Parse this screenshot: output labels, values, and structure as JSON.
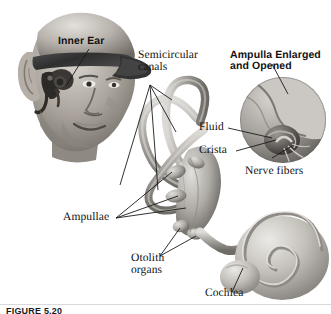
{
  "figure": {
    "title": "Inner Ear",
    "caption": "FIGURE 5.20",
    "background_color": "#ffffff",
    "ink_color": "#111111",
    "art_style": "grayscale airbrush anatomical illustration"
  },
  "labels": {
    "inner_ear": "Inner Ear",
    "semicircular_canals_line1": "Semicircular",
    "semicircular_canals_line2": "canals",
    "ampulla_enlarged_line1": "Ampulla Enlarged",
    "ampulla_enlarged_line2": "and Opened",
    "fluid": "Fluid",
    "crista": "Crista",
    "nerve_fibers": "Nerve fibers",
    "ampullae": "Ampullae",
    "otolith_organs_line1": "Otolith",
    "otolith_organs_line2": "organs",
    "cochlea": "Cochlea"
  },
  "colors": {
    "ink": "#111111",
    "leader_line": "#1b1b1b",
    "head_skin_light": "#d8d4cf",
    "head_skin_mid": "#a9a39c",
    "head_skin_dark": "#6f6a65",
    "cap_dark": "#3a3a3a",
    "labyrinth_light": "#d2d0cd",
    "labyrinth_mid": "#a3a09c",
    "labyrinth_dark": "#6b6864",
    "inset_disc_light": "#cfcdc9",
    "inset_disc_mid": "#9d9a95",
    "inset_disc_dark": "#585450",
    "cochlea_light": "#e0ded9",
    "cochlea_mid": "#b2afa9",
    "cochlea_dark": "#7b7772"
  },
  "parts": [
    {
      "name": "head",
      "description": "Man's head in three-quarter view with cap brim"
    },
    {
      "name": "inner-ear-embedded",
      "description": "Dark inner ear structure shown inside the skull"
    },
    {
      "name": "semicircular-canals",
      "description": "Three looping tubular canals of the vestibular labyrinth"
    },
    {
      "name": "vestibule-ampullae",
      "description": "Bulging ampullae at canal bases"
    },
    {
      "name": "otolith-organs",
      "description": "Utricle and saccule sacs"
    },
    {
      "name": "cochlea",
      "description": "Spiral snail-shell shaped cochlea"
    },
    {
      "name": "ampulla-inset",
      "description": "Circular magnified cut-away view of an ampulla"
    }
  ]
}
